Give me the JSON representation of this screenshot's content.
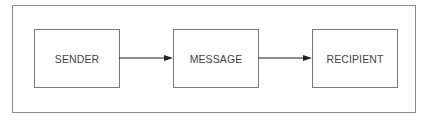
{
  "diagram": {
    "nodes": [
      {
        "id": "sender",
        "label": "SENDER"
      },
      {
        "id": "message",
        "label": "MESSAGE"
      },
      {
        "id": "recipient",
        "label": "RECIPIENT"
      }
    ],
    "edges": [
      {
        "from": "sender",
        "to": "message"
      },
      {
        "from": "message",
        "to": "recipient"
      }
    ],
    "colors": {
      "stroke": "#7a7a7a",
      "arrow": "#222222",
      "text": "#444444"
    }
  }
}
